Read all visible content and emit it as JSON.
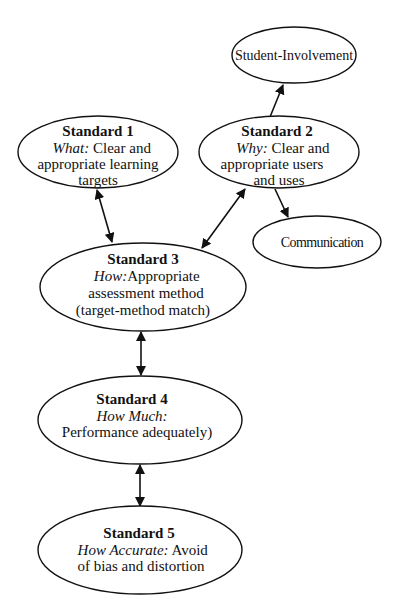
{
  "diagram": {
    "nodes": {
      "student_involvement": {
        "label": "Student-Involvement"
      },
      "standard1": {
        "title": "Standard 1",
        "lead": "What:",
        "line1_rest": " Clear and",
        "line2": "appropriate learning",
        "line3": "targets"
      },
      "standard2": {
        "title": "Standard 2",
        "lead": "Why:",
        "line1_rest": " Clear and",
        "line2": "appropriate users",
        "line3": "and uses"
      },
      "communication": {
        "label": "Communication"
      },
      "standard3": {
        "title": "Standard 3",
        "lead": "How:",
        "line1_rest": "Appropriate",
        "line2": "assessment method",
        "line3": "(target-method match)"
      },
      "standard4": {
        "title": "Standard 4",
        "lead": "How Much:",
        "line2": "Performance adequately)"
      },
      "standard5": {
        "title": "Standard 5",
        "lead": "How Accurate:",
        "line1_rest": " Avoid",
        "line2": "of bias and distortion"
      }
    },
    "edges": [
      {
        "from": "Standard 1",
        "to": "Standard 3",
        "type": "bidirectional"
      },
      {
        "from": "Standard 2",
        "to": "Standard 3",
        "type": "bidirectional"
      },
      {
        "from": "Standard 2",
        "to": "Student-Involvement",
        "type": "directed"
      },
      {
        "from": "Standard 2",
        "to": "Communication",
        "type": "directed"
      },
      {
        "from": "Standard 3",
        "to": "Standard 4",
        "type": "bidirectional"
      },
      {
        "from": "Standard 4",
        "to": "Standard 5",
        "type": "bidirectional"
      }
    ],
    "colors": {
      "stroke": "#111111",
      "background": "#ffffff"
    }
  }
}
